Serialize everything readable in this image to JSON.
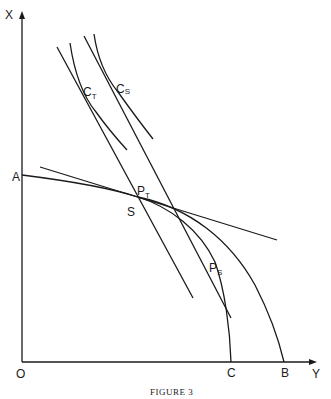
{
  "figure": {
    "caption": "FIGURE 3",
    "axes": {
      "x_label": "Y",
      "y_label": "X",
      "origin_label": "O"
    },
    "points": {
      "A": "A",
      "B": "B",
      "C": "C",
      "S": "S",
      "PT_main": "P",
      "PT_sub": "T",
      "PS_main": "P",
      "PS_sub": "S",
      "CT_main": "C",
      "CT_sub": "T",
      "CS_main": "C",
      "CS_sub": "S"
    },
    "colors": {
      "ink": "#1a1a1a",
      "background": "#ffffff"
    }
  }
}
